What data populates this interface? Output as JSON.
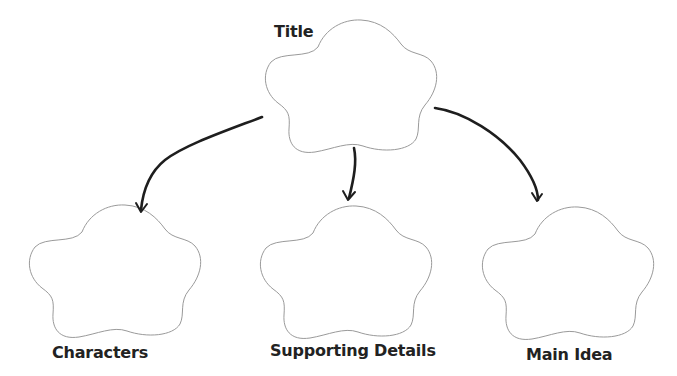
{
  "diagram": {
    "type": "graphic-organizer",
    "style": {
      "shape_stroke": "#9a9a9a",
      "arrow_color": "#1e1e1e",
      "label_color": "#222222",
      "background": "#ffffff"
    },
    "nodes": [
      {
        "id": "title",
        "label": "Title",
        "shape": "flower-cloud",
        "position": "top-center"
      },
      {
        "id": "characters",
        "label": "Characters",
        "shape": "flower-cloud",
        "position": "bottom-left"
      },
      {
        "id": "supporting_details",
        "label": "Supporting Details",
        "shape": "flower-cloud",
        "position": "bottom-center"
      },
      {
        "id": "main_idea",
        "label": "Main Idea",
        "shape": "flower-cloud",
        "position": "bottom-right"
      }
    ],
    "edges": [
      {
        "from": "title",
        "to": "characters",
        "style": "hand-drawn-arrow"
      },
      {
        "from": "title",
        "to": "supporting_details",
        "style": "hand-drawn-arrow"
      },
      {
        "from": "title",
        "to": "main_idea",
        "style": "hand-drawn-arrow"
      }
    ]
  }
}
